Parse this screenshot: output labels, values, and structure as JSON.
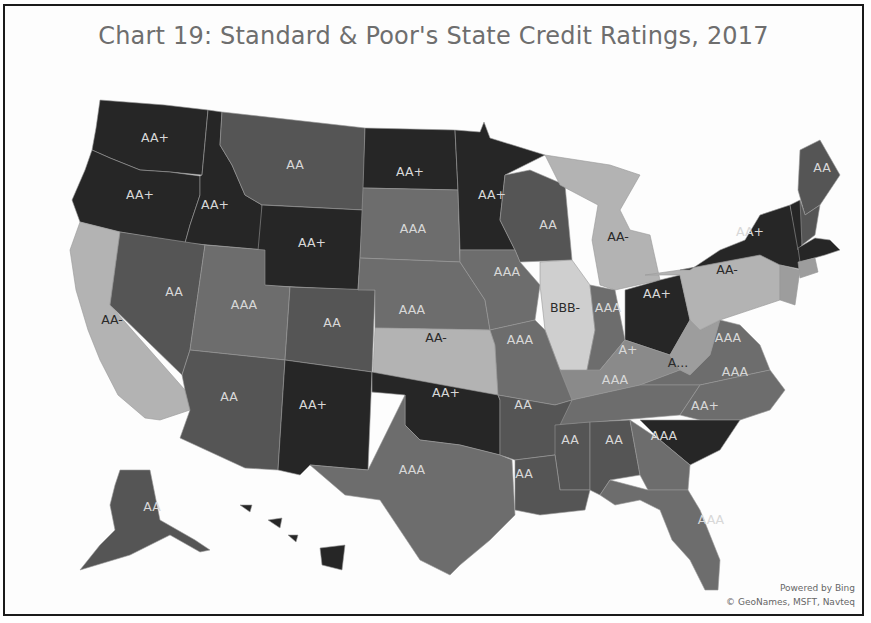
{
  "title": "Chart 19: Standard & Poor's State Credit Ratings, 2017",
  "credits": {
    "line1": "Powered by Bing",
    "line2": "© GeoNames, MSFT, Navteq"
  },
  "rating_colors": {
    "AAA": "#6d6d6d",
    "AA+": "#262626",
    "AA": "#555555",
    "AA-": "#b3b3b3",
    "A+": "#8a8a8a",
    "A": "#9d9d9d",
    "BBB-": "#cfcfcf"
  },
  "label_colors": {
    "light": "#d8d8d8",
    "dark": "#2a2a2a"
  },
  "chart_data": {
    "type": "choropleth",
    "title": "Chart 19: Standard & Poor's State Credit Ratings, 2017",
    "metric": "S&P state credit rating",
    "states": [
      {
        "state": "Washington",
        "abbr": "WA",
        "rating": "AA+"
      },
      {
        "state": "Oregon",
        "abbr": "OR",
        "rating": "AA+"
      },
      {
        "state": "Idaho",
        "abbr": "ID",
        "rating": "AA+"
      },
      {
        "state": "Montana",
        "abbr": "MT",
        "rating": "AA"
      },
      {
        "state": "Wyoming",
        "abbr": "WY",
        "rating": "AA+"
      },
      {
        "state": "North Dakota",
        "abbr": "ND",
        "rating": "AA+"
      },
      {
        "state": "South Dakota",
        "abbr": "SD",
        "rating": "AAA"
      },
      {
        "state": "Minnesota",
        "abbr": "MN",
        "rating": "AA+"
      },
      {
        "state": "Wisconsin",
        "abbr": "WI",
        "rating": "AA"
      },
      {
        "state": "Michigan",
        "abbr": "MI",
        "rating": "AA-"
      },
      {
        "state": "California",
        "abbr": "CA",
        "rating": "AA-"
      },
      {
        "state": "Nevada",
        "abbr": "NV",
        "rating": "AA"
      },
      {
        "state": "Utah",
        "abbr": "UT",
        "rating": "AAA"
      },
      {
        "state": "Colorado",
        "abbr": "CO",
        "rating": "AA"
      },
      {
        "state": "Nebraska",
        "abbr": "NE",
        "rating": "AAA"
      },
      {
        "state": "Iowa",
        "abbr": "IA",
        "rating": "AAA"
      },
      {
        "state": "Illinois",
        "abbr": "IL",
        "rating": "BBB-"
      },
      {
        "state": "Indiana",
        "abbr": "IN",
        "rating": "AAA"
      },
      {
        "state": "Ohio",
        "abbr": "OH",
        "rating": "AA+"
      },
      {
        "state": "Kansas",
        "abbr": "KS",
        "rating": "AA-"
      },
      {
        "state": "Missouri",
        "abbr": "MO",
        "rating": "AAA"
      },
      {
        "state": "Kentucky",
        "abbr": "KY",
        "rating": "A+"
      },
      {
        "state": "West Virginia",
        "abbr": "WV",
        "rating": "A...",
        "note": "label truncated on map"
      },
      {
        "state": "Virginia",
        "abbr": "VA",
        "rating": "AAA"
      },
      {
        "state": "Pennsylvania",
        "abbr": "PA",
        "rating": "AA-"
      },
      {
        "state": "New York",
        "abbr": "NY",
        "rating": "AA+"
      },
      {
        "state": "Maine",
        "abbr": "ME",
        "rating": "AA"
      },
      {
        "state": "Vermont",
        "abbr": "VT",
        "rating": "AA+"
      },
      {
        "state": "New Hampshire",
        "abbr": "NH",
        "rating": "AA"
      },
      {
        "state": "Massachusetts",
        "abbr": "MA",
        "rating": "AA+"
      },
      {
        "state": "Connecticut",
        "abbr": "CT",
        "rating": "A"
      },
      {
        "state": "New Jersey",
        "abbr": "NJ",
        "rating": "A"
      },
      {
        "state": "Arizona",
        "abbr": "AZ",
        "rating": "AA"
      },
      {
        "state": "New Mexico",
        "abbr": "NM",
        "rating": "AA+"
      },
      {
        "state": "Oklahoma",
        "abbr": "OK",
        "rating": "AA+"
      },
      {
        "state": "Texas",
        "abbr": "TX",
        "rating": "AAA"
      },
      {
        "state": "Arkansas",
        "abbr": "AR",
        "rating": "AA"
      },
      {
        "state": "Tennessee",
        "abbr": "TN",
        "rating": "AAA"
      },
      {
        "state": "North Carolina",
        "abbr": "NC",
        "rating": "AAA"
      },
      {
        "state": "South Carolina",
        "abbr": "SC",
        "rating": "AA+"
      },
      {
        "state": "Louisiana",
        "abbr": "LA",
        "rating": "AA"
      },
      {
        "state": "Mississippi",
        "abbr": "MS",
        "rating": "AA"
      },
      {
        "state": "Alabama",
        "abbr": "AL",
        "rating": "AA"
      },
      {
        "state": "Georgia",
        "abbr": "GA",
        "rating": "AAA"
      },
      {
        "state": "Florida",
        "abbr": "FL",
        "rating": "AAA"
      },
      {
        "state": "Alaska",
        "abbr": "AK",
        "rating": "AA"
      },
      {
        "state": "Hawaii",
        "abbr": "HI",
        "rating": "AA+"
      }
    ],
    "labels_shown": [
      {
        "abbr": "WA",
        "text": "AA+"
      },
      {
        "abbr": "OR",
        "text": "AA+"
      },
      {
        "abbr": "ID",
        "text": "AA+"
      },
      {
        "abbr": "MT",
        "text": "AA"
      },
      {
        "abbr": "ND",
        "text": "AA+"
      },
      {
        "abbr": "MN",
        "text": "AA+"
      },
      {
        "abbr": "WY",
        "text": "AA+"
      },
      {
        "abbr": "SD",
        "text": "AAA"
      },
      {
        "abbr": "WI",
        "text": "AA"
      },
      {
        "abbr": "MI",
        "text": "AA-"
      },
      {
        "abbr": "ME",
        "text": "AA"
      },
      {
        "abbr": "NY",
        "text": "AA+"
      },
      {
        "abbr": "PA",
        "text": "AA-"
      },
      {
        "abbr": "NV",
        "text": "AA"
      },
      {
        "abbr": "UT",
        "text": "AAA"
      },
      {
        "abbr": "CO",
        "text": "AA"
      },
      {
        "abbr": "NE",
        "text": "AAA"
      },
      {
        "abbr": "IA",
        "text": "AAA"
      },
      {
        "abbr": "IL",
        "text": "BBB-"
      },
      {
        "abbr": "IN",
        "text": "AAA"
      },
      {
        "abbr": "OH",
        "text": "AA+"
      },
      {
        "abbr": "CA",
        "text": "AA-"
      },
      {
        "abbr": "KS",
        "text": "AA-"
      },
      {
        "abbr": "MO",
        "text": "AAA"
      },
      {
        "abbr": "KY",
        "text": "A+"
      },
      {
        "abbr": "WV",
        "text": "A..."
      },
      {
        "abbr": "VA",
        "text": "AAA"
      },
      {
        "abbr": "TN",
        "text": "AAA"
      },
      {
        "abbr": "NC",
        "text": "AAA"
      },
      {
        "abbr": "AZ",
        "text": "AA"
      },
      {
        "abbr": "NM",
        "text": "AA+"
      },
      {
        "abbr": "OK",
        "text": "AA+"
      },
      {
        "abbr": "AR",
        "text": "AA"
      },
      {
        "abbr": "SC",
        "text": "AA+"
      },
      {
        "abbr": "MS",
        "text": "AA"
      },
      {
        "abbr": "AL",
        "text": "AA"
      },
      {
        "abbr": "GA",
        "text": "AAA"
      },
      {
        "abbr": "TX",
        "text": "AAA"
      },
      {
        "abbr": "LA",
        "text": "AA"
      },
      {
        "abbr": "FL",
        "text": "AAA"
      },
      {
        "abbr": "AK",
        "text": "AA"
      }
    ]
  }
}
